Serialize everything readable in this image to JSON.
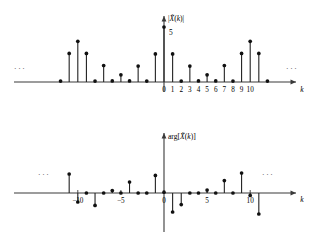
{
  "figure": {
    "width": 322,
    "height": 238,
    "background": "#ffffff",
    "ink_color": "#111111",
    "axis_color": "#3a3a3a"
  },
  "chart_data": [
    {
      "id": "magnitude-plot",
      "type": "stem",
      "title": "",
      "ylabel": "|X̃(k)|",
      "ylabel_parts": {
        "prefix": "|",
        "symbol": "X",
        "tilde": "̃",
        "arg_open": "(",
        "variable": "k",
        "arg_close": ")",
        "suffix": "|"
      },
      "xlabel": "k",
      "xlabel_italic": true,
      "annotation": "5",
      "annotation_k": 0,
      "annotation_value": 5,
      "tick_labels": [
        "0",
        "1",
        "2",
        "3",
        "4",
        "5",
        "6",
        "7",
        "8",
        "9",
        "10"
      ],
      "tick_ks": [
        0,
        1,
        2,
        3,
        4,
        5,
        6,
        7,
        8,
        9,
        10
      ],
      "xlim": [
        -13,
        14
      ],
      "ylim": [
        0,
        5.4
      ],
      "grid": false,
      "legend": null,
      "left_ellipsis": "···",
      "right_ellipsis": "···",
      "k": [
        -12,
        -11,
        -10,
        -9,
        -8,
        -7,
        -6,
        -5,
        -4,
        -3,
        -2,
        -1,
        0,
        1,
        2,
        3,
        4,
        5,
        6,
        7,
        8,
        9,
        10,
        11,
        12
      ],
      "values": [
        0.08,
        2.6,
        3.7,
        2.6,
        0.08,
        1.5,
        0.1,
        0.65,
        0.1,
        1.45,
        0.08,
        2.55,
        5.0,
        2.55,
        0.08,
        1.45,
        0.1,
        0.65,
        0.1,
        1.5,
        0.08,
        2.6,
        3.7,
        2.6,
        0.08
      ]
    },
    {
      "id": "phase-plot",
      "type": "stem",
      "title": "",
      "ylabel": "arg[X̃(k)]",
      "ylabel_parts": {
        "prefix": "arg[",
        "symbol": "X",
        "tilde": "̃",
        "arg_open": "(",
        "variable": "k",
        "arg_close": ")",
        "suffix": "]"
      },
      "xlabel": "k",
      "xlabel_italic": true,
      "tick_labels": [
        "−10",
        "−5",
        "0",
        "5",
        "10"
      ],
      "tick_ks": [
        -10,
        -5,
        0,
        5,
        10
      ],
      "xlim": [
        -13,
        14
      ],
      "ylim": [
        -1.35,
        1.35
      ],
      "grid": false,
      "legend": null,
      "left_ellipsis": "···",
      "right_ellipsis": "···",
      "k": [
        -11,
        -10,
        -9,
        -8,
        -7,
        -6,
        -5,
        -4,
        -3,
        -2,
        -1,
        0,
        1,
        2,
        3,
        4,
        5,
        6,
        7,
        8,
        9,
        10,
        11
      ],
      "values": [
        0.95,
        -0.45,
        0.0,
        -0.62,
        0.0,
        0.12,
        0.0,
        0.55,
        0.0,
        0.0,
        0.88,
        0.04,
        -0.95,
        -0.58,
        0.0,
        0.0,
        0.15,
        0.0,
        0.62,
        0.0,
        1.0,
        -0.12,
        -1.05
      ]
    }
  ]
}
